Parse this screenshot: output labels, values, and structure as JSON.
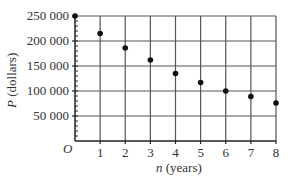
{
  "chart_data": {
    "type": "scatter",
    "title": "",
    "xlabel_var": "n",
    "xlabel_rest": " (years)",
    "ylabel_var": "P",
    "ylabel_rest": " (dollars)",
    "origin_label": "O",
    "xlim": [
      0,
      8
    ],
    "ylim": [
      0,
      250000
    ],
    "grid": true,
    "x_ticks": [
      1,
      2,
      3,
      4,
      5,
      6,
      7,
      8
    ],
    "x_tick_labels": [
      "1",
      "2",
      "3",
      "4",
      "5",
      "6",
      "7",
      "8"
    ],
    "y_ticks": [
      50000,
      100000,
      150000,
      200000,
      250000
    ],
    "y_tick_labels": [
      "50 000",
      "100 000",
      "150 000",
      "200 000",
      "250 000"
    ],
    "y_minor_step": 10000,
    "series": [
      {
        "name": "P",
        "x": [
          0,
          1,
          2,
          3,
          4,
          5,
          6,
          7,
          8
        ],
        "values": [
          250000,
          215000,
          186000,
          162000,
          135000,
          117000,
          100000,
          89000,
          76000
        ]
      }
    ],
    "colors": {
      "grid": "#555555",
      "axis": "#222222",
      "point": "#111111",
      "text": "#333333"
    }
  }
}
